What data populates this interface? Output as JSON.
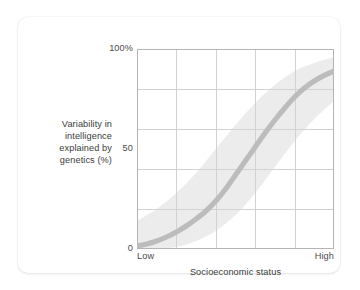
{
  "figure": {
    "y_axis_title": "Variability in\nintelligence\nexplained by\ngenetics (%)",
    "x_axis_title": "Socioeconomic status",
    "ytick_top": "100%",
    "ytick_mid": "50",
    "ytick_bottom": "0",
    "xtick_left": "Low",
    "xtick_right": "High"
  },
  "colors": {
    "curve": "#bcbcbc",
    "band": "#e4e4e4",
    "grid": "#d2d2d2",
    "frame": "#b4b4b4",
    "text": "#3b3b3b",
    "card": "#ffffff"
  },
  "chart_data": {
    "type": "line",
    "title": "",
    "subtitle": "",
    "xlabel": "Socioeconomic status",
    "ylabel": "Variability in intelligence explained by genetics (%)",
    "xlim": [
      0,
      100
    ],
    "ylim": [
      0,
      100
    ],
    "x_tick_labels": [
      "Low",
      "High"
    ],
    "x_tick_positions": [
      0,
      100
    ],
    "y_tick_labels": [
      "0",
      "50",
      "100%"
    ],
    "y_tick_positions": [
      0,
      50,
      100
    ],
    "grid": true,
    "grid_columns": 5,
    "grid_rows": 5,
    "legend": "none",
    "annotations": [],
    "series": [
      {
        "name": "Heritability estimate",
        "type": "line",
        "x": [
          0,
          5,
          10,
          15,
          20,
          25,
          30,
          35,
          40,
          45,
          50,
          55,
          60,
          65,
          70,
          75,
          80,
          85,
          90,
          95,
          100
        ],
        "values": [
          1.5,
          2.5,
          4,
          6,
          8.5,
          11.5,
          15,
          19,
          24,
          30,
          37,
          44,
          51,
          58,
          64.5,
          70.5,
          76,
          80.5,
          84,
          86.8,
          89
        ]
      },
      {
        "name": "Uncertainty band upper",
        "type": "band_upper",
        "x": [
          0,
          10,
          20,
          30,
          40,
          50,
          60,
          70,
          80,
          90,
          100
        ],
        "values": [
          14,
          20,
          28,
          38,
          50,
          62,
          73,
          82,
          89,
          93,
          96
        ]
      },
      {
        "name": "Uncertainty band lower",
        "type": "band_lower",
        "x": [
          0,
          10,
          20,
          30,
          40,
          50,
          60,
          70,
          80,
          90,
          100
        ],
        "values": [
          0,
          0,
          1,
          4,
          9,
          17,
          28,
          41,
          54,
          65,
          74
        ]
      }
    ]
  }
}
